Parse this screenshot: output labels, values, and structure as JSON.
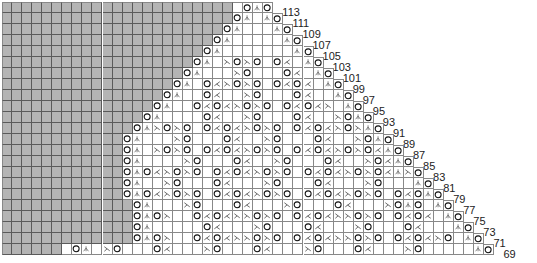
{
  "chart_title": "Lace knitting chart",
  "grid": {
    "cell_w": 10.05,
    "cell_h": 11,
    "bottom_row_cols": 49,
    "gray_color": "#b4b4b4",
    "line_color": "#888888"
  },
  "legend_symbols": {
    "O": "yarn-over",
    "/": "k2tog",
    "\\": "ssk",
    "^": "centered-double-decrease",
    ".": "knit"
  },
  "rows": [
    {
      "label": "113",
      "cells": ". O ^ O"
    },
    {
      "label": "111",
      "cells": "O ^ . ^ O"
    },
    {
      "label": "109",
      "cells": "O ^ . . . ^ O"
    },
    {
      "label": "107",
      "cells": "O ^ . . . . . ^ O"
    },
    {
      "label": "105",
      "cells": "O ^ . . . . . . . ^ O"
    },
    {
      "label": "103",
      "cells": "O ^ . \\ O \\ O . O / . ^ O"
    },
    {
      "label": "101",
      "cells": "O ^ . . . \\ O . . . O / . ^ O"
    },
    {
      "label": "99",
      "cells": "O ^ . O / \\ O \\ O . O / O / . ^ O"
    },
    {
      "label": "97",
      "cells": "O ^ . . O / . . \\ O . . . O / . . ^ O"
    },
    {
      "label": "95",
      "cells": "O ^ . . O / O / \\ O \\ O . O / O / \\ . ^ O"
    },
    {
      "label": "93",
      "cells": "O ^ . . . . O / . . \\ O . . . O / . . \\ O ^ O"
    },
    {
      "label": "91",
      "cells": "O ^ \\ O \\ O . O / O / \\ O \\ O . O / O / \\ O \\ ^ O"
    },
    {
      "label": "89",
      "cells": "O ^ . . . \\ O . . . O / . . \\ O . . . O / . . \\ O ^ O"
    },
    {
      "label": "87",
      "cells": "O ^ . \\ O \\ O . O / O / \\ O \\ O . O / O / \\ O \\ O / ^ O"
    },
    {
      "label": "85",
      "cells": "O ^ . . . . \\ O . . . O / . . \\ O . . . O / . . \\ O / ^ O"
    },
    {
      "label": "83",
      "cells": "O ^ O / \\ O \\ O . O / O / \\ O \\ O . O / O / \\ O \\ O / ^ \\ O"
    },
    {
      "label": "81",
      "cells": "O ^ . . \\ O . . . O / . . . \\ O . . . O / . . . \\ O . . . ^ O"
    },
    {
      "label": "79",
      "cells": "O ^ O / \\ O \\ O . O / O / \\ O \\ O . O / O / \\ O \\ O . O / O ^ O"
    },
    {
      "label": "77",
      "cells": "O ^ . . . \\ O . . . O / . . . \\ O . . . O / . . . \\ O ^ O . ^ O"
    },
    {
      "label": "75",
      "cells": "O ^ O \\ . . O / O / \\ \\ O \\ O . O / O / \\ \\ O \\ O . O / O / . ^ O"
    },
    {
      "label": "73",
      "cells": "O ^ . . . . . O / . . . \\ O . . . O / . . . \\ O . . . O / . . . ^ O"
    },
    {
      "label": "71",
      "cells": "O ^ O \\ . . O / O / \\ \\ O \\ O . O / O / \\ \\ O \\ O . O / O / \\ O . ^ O"
    },
    {
      "label": "69",
      "cells": ". O ^ . \\ O . . . O / . . . \\ O . . . O / . . . \\ O . . . O / . . . \\ O . . . . . ^ O"
    }
  ]
}
